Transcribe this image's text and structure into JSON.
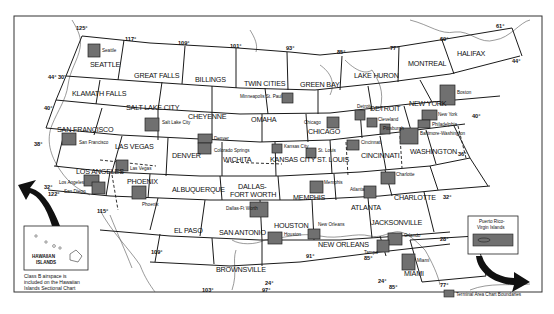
{
  "map": {
    "title": "Sectional and Terminal Area Chart Coverage",
    "sectional_charts": [
      {
        "id": "seattle",
        "label": "SEATTLE"
      },
      {
        "id": "great_falls",
        "label": "GREAT FALLS"
      },
      {
        "id": "billings",
        "label": "BILLINGS"
      },
      {
        "id": "twin_cities",
        "label": "TWIN CITIES"
      },
      {
        "id": "green_bay",
        "label": "GREEN BAY"
      },
      {
        "id": "lake_huron",
        "label": "LAKE HURON"
      },
      {
        "id": "montreal",
        "label": "MONTREAL"
      },
      {
        "id": "halifax",
        "label": "HALIFAX"
      },
      {
        "id": "klamath_falls",
        "label": "KLAMATH FALLS"
      },
      {
        "id": "salt_lake_city",
        "label": "SALT LAKE CITY"
      },
      {
        "id": "cheyenne",
        "label": "CHEYENNE"
      },
      {
        "id": "omaha",
        "label": "OMAHA"
      },
      {
        "id": "chicago",
        "label": "CHICAGO"
      },
      {
        "id": "detroit",
        "label": "DETROIT"
      },
      {
        "id": "new_york",
        "label": "NEW YORK"
      },
      {
        "id": "san_francisco",
        "label": "SAN FRANCISCO"
      },
      {
        "id": "las_vegas",
        "label": "LAS VEGAS"
      },
      {
        "id": "denver",
        "label": "DENVER"
      },
      {
        "id": "wichita",
        "label": "WICHITA"
      },
      {
        "id": "kansas_city",
        "label": "KANSAS CITY"
      },
      {
        "id": "st_louis",
        "label": "ST. LOUIS"
      },
      {
        "id": "cincinnati",
        "label": "CINCINNATI"
      },
      {
        "id": "washington",
        "label": "WASHINGTON"
      },
      {
        "id": "los_angeles",
        "label": "LOS ANGELES"
      },
      {
        "id": "phoenix",
        "label": "PHOENIX"
      },
      {
        "id": "albuquerque",
        "label": "ALBUQUERQUE"
      },
      {
        "id": "dallas_fort_worth_l1",
        "label": "DALLAS-"
      },
      {
        "id": "dallas_fort_worth_l2",
        "label": "FORT WORTH"
      },
      {
        "id": "memphis",
        "label": "MEMPHIS"
      },
      {
        "id": "atlanta",
        "label": "ATLANTA"
      },
      {
        "id": "charlotte",
        "label": "CHARLOTTE"
      },
      {
        "id": "el_paso",
        "label": "EL PASO"
      },
      {
        "id": "san_antonio",
        "label": "SAN ANTONIO"
      },
      {
        "id": "houston",
        "label": "HOUSTON"
      },
      {
        "id": "new_orleans",
        "label": "NEW ORLEANS"
      },
      {
        "id": "jacksonville",
        "label": "JACKSONVILLE"
      },
      {
        "id": "brownsville",
        "label": "BROWNSVILLE"
      },
      {
        "id": "miami",
        "label": "MIAMI"
      }
    ],
    "terminal_area_charts": [
      {
        "label": "Seattle"
      },
      {
        "label": "Minneapolis St. Paul"
      },
      {
        "label": "Salt Lake City"
      },
      {
        "label": "San Francisco"
      },
      {
        "label": "Las Vegas"
      },
      {
        "label": "Denver"
      },
      {
        "label": "Colorado Springs"
      },
      {
        "label": "Kansas City"
      },
      {
        "label": "Chicago"
      },
      {
        "label": "St. Louis"
      },
      {
        "label": "Detroit"
      },
      {
        "label": "Cleveland"
      },
      {
        "label": "Pittsburgh"
      },
      {
        "label": "Cincinnati"
      },
      {
        "label": "Boston"
      },
      {
        "label": "New York"
      },
      {
        "label": "Philadelphia"
      },
      {
        "label": "Baltimore-Washington"
      },
      {
        "label": "Los Angeles"
      },
      {
        "label": "San Diego"
      },
      {
        "label": "Phoenix"
      },
      {
        "label": "Memphis"
      },
      {
        "label": "Atlanta"
      },
      {
        "label": "Charlotte"
      },
      {
        "label": "Dallas-Ft Worth"
      },
      {
        "label": "Houston"
      },
      {
        "label": "New Orleans"
      },
      {
        "label": "Orlando"
      },
      {
        "label": "Tampa"
      },
      {
        "label": "Miami"
      }
    ],
    "degree_labels": {
      "d125": "125°",
      "d117": "117°",
      "d109": "109°",
      "d101": "101°",
      "d93": "93°",
      "d85": "85°",
      "d77": "77°",
      "d69": "69°",
      "d61": "61°",
      "n44_30": "44° 30'",
      "n40": "40°",
      "n38": "38°",
      "n32_a": "32°",
      "n32_b": "32°",
      "n36": "36°",
      "n28": "28°",
      "n24_a": "24°",
      "n24_b": "24°",
      "n44": "44°",
      "w122": "122°",
      "w115": "115°",
      "w109": "109°",
      "w103": "103°",
      "w97": "97°",
      "w91": "91°",
      "w85_a": "85°",
      "w85_b": "85°",
      "w77_b": "77°"
    },
    "insets": {
      "hawaii": {
        "label_l1": "HAWAIIAN",
        "label_l2": "ISLANDS"
      },
      "puerto_rico": {
        "label_l1": "Puerto Rico-",
        "label_l2": "Virgin Islands"
      }
    },
    "note": {
      "line1": "Class B airspace is",
      "line2": "included on the Hawaiian",
      "line3": "Islands Sectional Chart"
    },
    "legend": {
      "label": "Terminal Area Chart Boundaries",
      "swatch_color": "#707070"
    },
    "colors": {
      "tac_fill": "#707070",
      "line": "#1a1a1a",
      "background": "#ffffff"
    }
  }
}
